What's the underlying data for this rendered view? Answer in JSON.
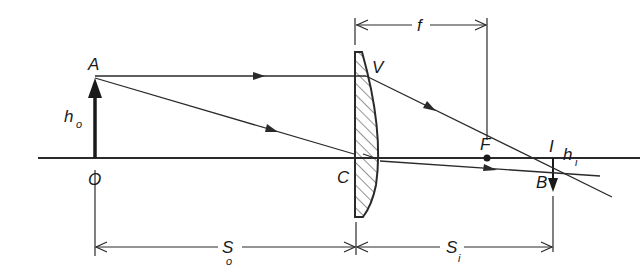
{
  "diagram": {
    "type": "thin lens ray diagram",
    "labels": {
      "object_top": "A",
      "object_base": "O",
      "object_height": "h",
      "object_height_sub": "o",
      "lens_center": "C",
      "lens_vertex": "V",
      "focal_point": "F",
      "focal_length": "f",
      "image_base": "I",
      "image_top": "B",
      "image_height": "h",
      "image_height_sub": "i",
      "object_distance": "S",
      "object_distance_sub": "o",
      "image_distance": "S",
      "image_distance_sub": "i"
    },
    "colors": {
      "line": "#2a2a2a",
      "background": "#ffffff"
    }
  }
}
